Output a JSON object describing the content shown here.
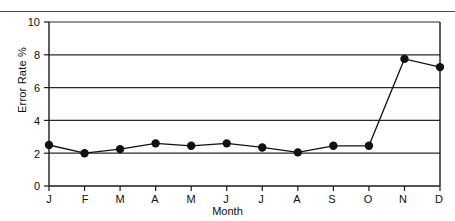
{
  "chart_data": {
    "type": "line",
    "title": "",
    "xlabel": "Month",
    "ylabel": "Error Rate %",
    "categories": [
      "J",
      "F",
      "M",
      "A",
      "M",
      "J",
      "J",
      "A",
      "S",
      "O",
      "N",
      "D"
    ],
    "category_names": [
      "January",
      "February",
      "March",
      "April",
      "May",
      "June",
      "July",
      "August",
      "September",
      "October",
      "November",
      "December"
    ],
    "values": [
      2.5,
      2.0,
      2.25,
      2.6,
      2.45,
      2.6,
      2.35,
      2.05,
      2.45,
      2.45,
      7.75,
      7.25
    ],
    "series": [
      {
        "name": "Error Rate %",
        "values": [
          2.5,
          2.0,
          2.25,
          2.6,
          2.45,
          2.6,
          2.35,
          2.05,
          2.45,
          2.45,
          7.75,
          7.25
        ]
      }
    ],
    "ylim": [
      0,
      10
    ],
    "yticks": [
      0,
      2,
      4,
      6,
      8,
      10
    ],
    "ytick_labels": [
      "0",
      "2",
      "4",
      "6",
      "8",
      "10"
    ],
    "xtick_labels": [
      "J",
      "F",
      "M",
      "A",
      "M",
      "J",
      "J",
      "A",
      "S",
      "O",
      "N",
      "D"
    ],
    "grid": "horizontal",
    "legend": "none",
    "marker": "filled-circle",
    "line_color": "#111111",
    "marker_color": "#111111",
    "grid_color": "#333333",
    "axis_color": "#222222",
    "background": "#ffffff"
  },
  "axis": {
    "y_title": "Error Rate %",
    "x_title": "Month"
  }
}
